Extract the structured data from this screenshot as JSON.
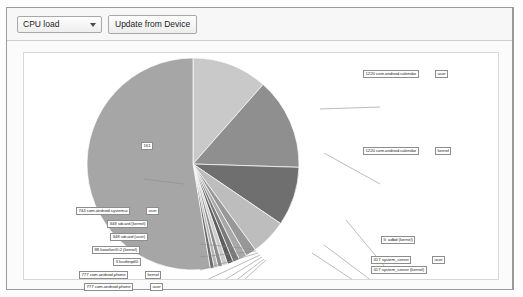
{
  "window": {
    "toolbar": {
      "dropdown": {
        "value": "CPU load",
        "options": [
          "CPU load",
          "Memory",
          "Network",
          "Battery"
        ],
        "caret_icon": "chevron-down-icon"
      },
      "update_button": "Update from Device"
    }
  },
  "chart_data": {
    "type": "pie",
    "title": "",
    "legend": "callout-labels",
    "unit": "percent of CPU load",
    "start_angle_deg": -90,
    "direction": "clockwise",
    "slices": [
      {
        "label": "1220 com.android.calendar (user)",
        "pid": "1220",
        "process": "com.android.calendar",
        "mode": "user",
        "value": 11.5,
        "color": "#c9c9c9"
      },
      {
        "label": "1220 com.android.calendar (kernel)",
        "pid": "1220",
        "process": "com.android.calendar",
        "mode": "kernel",
        "value": 14.0,
        "color": "#8f8f8f"
      },
      {
        "label": "5 adbd (kernel)",
        "pid": "5",
        "process": "adbd",
        "mode": "kernel",
        "value": 9.0,
        "color": "#6f6f6f"
      },
      {
        "label": "417 system_server (user)",
        "pid": "417",
        "process": "system_server",
        "mode": "user",
        "value": 5.5,
        "color": "#bdbdbd"
      },
      {
        "label": "417 system_server (kernel)",
        "pid": "417",
        "process": "system_server",
        "mode": "kernel",
        "value": 1.6,
        "color": "#989898"
      },
      {
        "label": "777 com.android.phone (user)",
        "pid": "777",
        "process": "com.android.phone",
        "mode": "user",
        "value": 1.2,
        "color": "#a8a8a8"
      },
      {
        "label": "777 com.android.phone (kernel)",
        "pid": "777",
        "process": "com.android.phone",
        "mode": "kernel",
        "value": 1.0,
        "color": "#7a7a7a"
      },
      {
        "label": "3 ksoftirqd/0",
        "pid": "3",
        "process": "ksoftirqd/0",
        "mode": "",
        "value": 0.9,
        "color": "#5e5e5e"
      },
      {
        "label": "88 kworker/0:2 (kernel)",
        "pid": "88",
        "process": "kworker/0:2",
        "mode": "kernel",
        "value": 0.8,
        "color": "#cccccc"
      },
      {
        "label": "348 sdcard (user)",
        "pid": "348",
        "process": "sdcard",
        "mode": "user",
        "value": 0.7,
        "color": "#8a8a8a"
      },
      {
        "label": "348 sdcard (kernel)",
        "pid": "348",
        "process": "sdcard",
        "mode": "kernel",
        "value": 0.6,
        "color": "#b2b2b2"
      },
      {
        "label": "744 com.android.systemui (user)",
        "pid": "744",
        "process": "com.android.systemui",
        "mode": "user",
        "value": 0.6,
        "color": "#6a6a6a"
      },
      {
        "label": "161",
        "pid": "161",
        "process": "",
        "mode": "",
        "value": 52.6,
        "color": "#a6a6a6"
      }
    ]
  },
  "callouts": [
    {
      "name": "callout-1220-user",
      "text": "1220 com.android.calendar",
      "suffix": "user",
      "x": 363,
      "y": 69,
      "suffix_x": 435
    },
    {
      "name": "callout-1220-kernel",
      "text": "1220 com.android.calendar",
      "suffix": "kernel",
      "x": 363,
      "y": 146,
      "suffix_x": 435
    },
    {
      "name": "callout-5-adbd",
      "text": "5: adbd (kernel)",
      "suffix": "",
      "x": 381,
      "y": 235,
      "suffix_x": 0
    },
    {
      "name": "callout-417-user",
      "text": "417 system_server",
      "suffix": "user",
      "x": 371,
      "y": 255,
      "suffix_x": 432
    },
    {
      "name": "callout-417-kernel",
      "text": "417 system_server (kernel)",
      "suffix": "",
      "x": 371,
      "y": 265,
      "suffix_x": 0
    },
    {
      "name": "callout-161",
      "text": "161",
      "suffix": "",
      "x": 141,
      "y": 141,
      "suffix_x": 0
    },
    {
      "name": "callout-744-systemui",
      "text": "744 com.android.systemui",
      "suffix": "user",
      "x": 76,
      "y": 206,
      "suffix_x": 146
    },
    {
      "name": "callout-348-kernel",
      "text": "348 sdcard (kernel)",
      "suffix": "",
      "x": 107,
      "y": 219,
      "suffix_x": 0
    },
    {
      "name": "callout-348-user",
      "text": "348 sdcard (user)",
      "suffix": "",
      "x": 110,
      "y": 232,
      "suffix_x": 0
    },
    {
      "name": "callout-88-kworker",
      "text": "88 kworker/0:2 (kernel)",
      "suffix": "",
      "x": 92,
      "y": 245,
      "suffix_x": 0
    },
    {
      "name": "callout-3-ksoftirqd",
      "text": "3 ksoftirqd/0",
      "suffix": "",
      "x": 113,
      "y": 257,
      "suffix_x": 0
    },
    {
      "name": "callout-777-kernel",
      "text": "777 com.android.phone",
      "suffix": "kernel",
      "x": 79,
      "y": 270,
      "suffix_x": 145
    },
    {
      "name": "callout-777-user",
      "text": "777 com.android.phone",
      "suffix": "user",
      "x": 84,
      "y": 282,
      "suffix_x": 150
    }
  ]
}
